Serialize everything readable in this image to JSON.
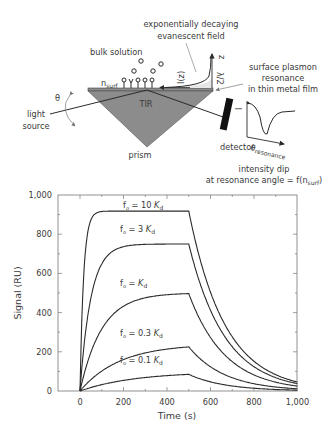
{
  "diagram": {
    "title_top": [
      "exponentially decaying",
      "evanescent field"
    ],
    "bulk_label": "bulk solution",
    "nsurf_label": "n",
    "nsurf_sub": "surf",
    "spr_label": [
      "surface plasmon",
      "resonance",
      "in thin metal film"
    ],
    "theta_label": "θ",
    "light_source_label": [
      "light",
      "source"
    ],
    "tir_label": "TIR",
    "prism_label": "prism",
    "detector_label": "detector",
    "intensity_axis_label": "I",
    "theta_res_label": "θ",
    "theta_res_sub": "resonance",
    "iz_label": "I(z)",
    "z_label": "z",
    "lambda_label": "λ/2",
    "dip_caption": [
      "intensity dip",
      "at resonance angle = f(n"
    ],
    "dip_caption_sub": "surf",
    "dip_caption_end": ")"
  },
  "chart_data": {
    "type": "line",
    "title": "",
    "xlabel": "Time (s)",
    "ylabel": "Signal (RU)",
    "xlim": [
      -100,
      1000
    ],
    "ylim": [
      0,
      1000
    ],
    "xticks": [
      "0",
      "200",
      "400",
      "600",
      "800",
      "1,000"
    ],
    "yticks": [
      "0",
      "200",
      "400",
      "600",
      "800",
      "1,000"
    ],
    "grid": false,
    "x": [
      0,
      50,
      100,
      200,
      300,
      400,
      500,
      600,
      700,
      800,
      900,
      1000
    ],
    "series": [
      {
        "name": "f₀ = 10 Kd",
        "label": "f",
        "label_sub": "o",
        "label_rest": " = 10 ",
        "label_k": "K",
        "label_ksub": "d",
        "values": [
          0,
          870,
          915,
          918,
          918,
          918,
          918,
          505,
          280,
          150,
          85,
          45
        ],
        "plateau": 918,
        "kobs": 0.06
      },
      {
        "name": "f₀ = 3 Kd",
        "label": "f",
        "label_sub": "o",
        "label_rest": " = 3 ",
        "label_k": "K",
        "label_ksub": "d",
        "values": [
          0,
          470,
          650,
          735,
          748,
          750,
          750,
          420,
          230,
          125,
          68,
          35
        ],
        "plateau": 750,
        "kobs": 0.02
      },
      {
        "name": "f₀ = Kd",
        "label": "f",
        "label_sub": "o",
        "label_rest": " = ",
        "label_k": "K",
        "label_ksub": "d",
        "values": [
          0,
          195,
          315,
          430,
          475,
          490,
          497,
          275,
          150,
          82,
          45,
          25
        ],
        "plateau": 500,
        "kobs": 0.01
      },
      {
        "name": "f₀ = 0.3 Kd",
        "label": "f",
        "label_sub": "o",
        "label_rest": " = 0.3 ",
        "label_k": "K",
        "label_ksub": "d",
        "values": [
          0,
          55,
          95,
          150,
          190,
          212,
          225,
          118,
          60,
          30,
          16,
          10
        ],
        "plateau": 240,
        "kobs": 0.0055
      },
      {
        "name": "f₀ = 0.1 Kd",
        "label": "f",
        "label_sub": "o",
        "label_rest": " = 0.1 ",
        "label_k": "K",
        "label_ksub": "d",
        "values": [
          0,
          18,
          30,
          50,
          65,
          77,
          85,
          42,
          20,
          10,
          5,
          3
        ],
        "plateau": 100,
        "kobs": 0.004
      }
    ],
    "legend": "inline labels above curves",
    "annotations": [
      "association phase 0–500 s",
      "dissociation phase 500–1,000 s"
    ]
  }
}
